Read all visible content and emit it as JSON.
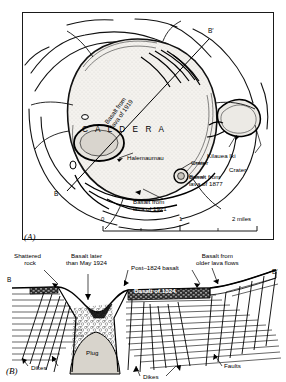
{
  "figure": {
    "type": "geologic-map-and-cross-section"
  },
  "panel_a": {
    "tag": "(A)",
    "type": "map",
    "caldera_label": "C A L D E R A",
    "section_line": {
      "start_label": "B",
      "end_label": "B′"
    },
    "labels": [
      {
        "name": "basalt-1919",
        "text": "Basalt from\nlava of 1919",
        "rotated": true
      },
      {
        "name": "halemaumau",
        "text": "Halemaumau"
      },
      {
        "name": "kilauea-iki",
        "text": "Kilauea Iki"
      },
      {
        "name": "crater-right",
        "text": "Crater"
      },
      {
        "name": "crater-center",
        "text": "Crater"
      },
      {
        "name": "basalt-1877",
        "text": "Basalt from\nlava of 1877"
      },
      {
        "name": "basalt-1921",
        "text": "Basalt from\nlava of 1921"
      }
    ],
    "scale_bar": {
      "ticks": [
        "0",
        "1"
      ],
      "end_label": "2 miles",
      "unit": "miles"
    }
  },
  "panel_b": {
    "tag": "(B)",
    "type": "cross-section",
    "endpoints": {
      "left": "B",
      "right": "B′"
    },
    "labels": [
      {
        "name": "shattered-rock",
        "text": "Shattered\nrock"
      },
      {
        "name": "basalt-later-1924",
        "text": "Basalt later\nthan May 1924"
      },
      {
        "name": "post-1824-basalt",
        "text": "Post–1824 basalt"
      },
      {
        "name": "basalt-older-flows",
        "text": "Basalt from\nolder lava flows"
      },
      {
        "name": "basalt-of-1824",
        "text": "Basalt of 1824"
      },
      {
        "name": "plug",
        "text": "Plug"
      },
      {
        "name": "dikes-left",
        "text": "Dikes"
      },
      {
        "name": "dikes-center",
        "text": "Dikes"
      },
      {
        "name": "faults",
        "text": "Faults"
      }
    ]
  },
  "colors": {
    "ink": "#000000",
    "paper": "#ffffff",
    "plug_fill": "#d8d4cc",
    "caldera_fill": "#f2f0ec",
    "basalt_1824_fill": "#3a3a3a"
  }
}
